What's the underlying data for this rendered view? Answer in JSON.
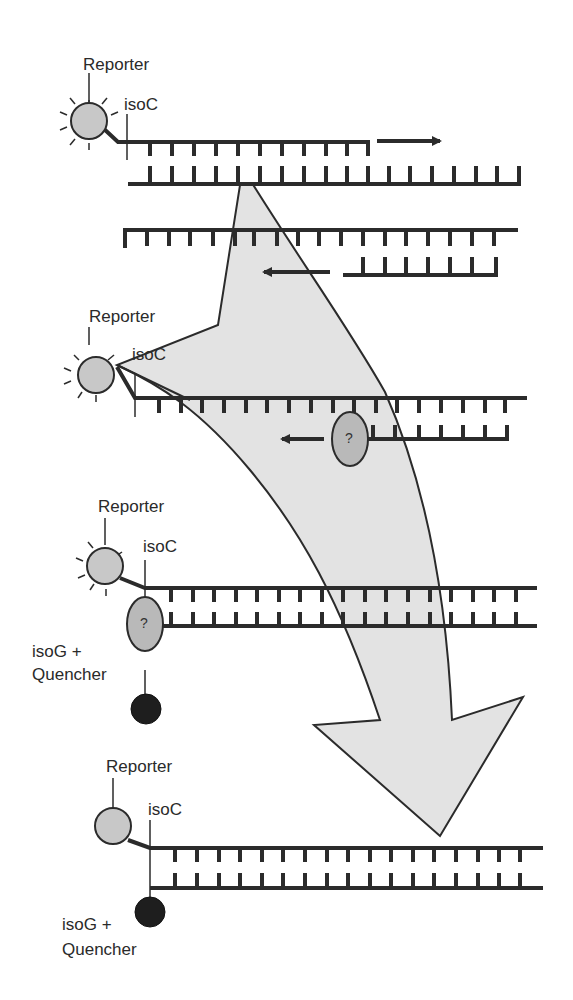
{
  "diagram": {
    "title": "",
    "colors": {
      "strand": "#2b2b2b",
      "arrow_fill": "#e3e3e3",
      "reporter_fill": "#c8c8c8",
      "quencher_fill": "#1e1e1e",
      "enzyme_fill": "#b9b9b9"
    },
    "stages": [
      {
        "id": "stage-1",
        "labels": {
          "reporter": "Reporter",
          "base": "isoC"
        }
      },
      {
        "id": "stage-2",
        "labels": {
          "reporter": "Reporter",
          "base": "isoC"
        },
        "enzyme_label": "?"
      },
      {
        "id": "stage-3",
        "labels": {
          "reporter": "Reporter",
          "base": "isoC",
          "quencher_line1": "isoG +",
          "quencher_line2": "Quencher"
        },
        "enzyme_label": "?"
      },
      {
        "id": "stage-4",
        "labels": {
          "reporter": "Reporter",
          "base": "isoC",
          "quencher_line1": "isoG +",
          "quencher_line2": "Quencher"
        }
      }
    ]
  }
}
